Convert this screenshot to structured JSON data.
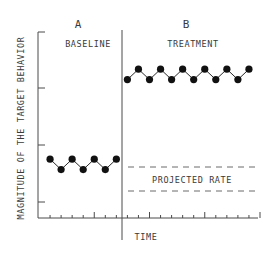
{
  "chart_data": {
    "type": "line",
    "title": "",
    "xlabel": "TIME",
    "ylabel": "MAGNITUDE OF THE TARGET BEHAVIOR",
    "grid": false,
    "legend": null,
    "phases": [
      {
        "id": "A",
        "label": "BASELINE"
      },
      {
        "id": "B",
        "label": "TREATMENT"
      }
    ],
    "series": [
      {
        "name": "BASELINE",
        "phase": "A",
        "x": [
          1,
          2,
          3,
          4,
          5,
          6,
          7
        ],
        "values": [
          2.2,
          1.9,
          2.2,
          1.9,
          2.2,
          1.9,
          2.2
        ]
      },
      {
        "name": "TREATMENT",
        "phase": "B",
        "x": [
          8,
          9,
          10,
          11,
          12,
          13,
          14,
          15,
          16,
          17,
          18,
          19
        ],
        "values": [
          4.5,
          4.8,
          4.5,
          4.8,
          4.5,
          4.8,
          4.5,
          4.8,
          4.5,
          4.8,
          4.5,
          4.8
        ]
      }
    ],
    "annotations": [
      {
        "text": "PROJECTED RATE",
        "type": "dashed-band",
        "phase": "B",
        "y_range": [
          1.5,
          2.3
        ]
      }
    ],
    "xlim": [
      0,
      20
    ],
    "ylim": [
      0.5,
      5.5
    ],
    "phase_change_after_x": 7
  },
  "labels": {
    "phase_a": "A",
    "phase_b": "B",
    "baseline": "BASELINE",
    "treatment": "TREATMENT",
    "projected": "PROJECTED RATE",
    "xlabel": "TIME",
    "ylabel": "MAGNITUDE OF THE TARGET BEHAVIOR"
  },
  "colors": {
    "axis": "#4a4a4a",
    "points": "#111111",
    "text": "#3a3a3a"
  }
}
